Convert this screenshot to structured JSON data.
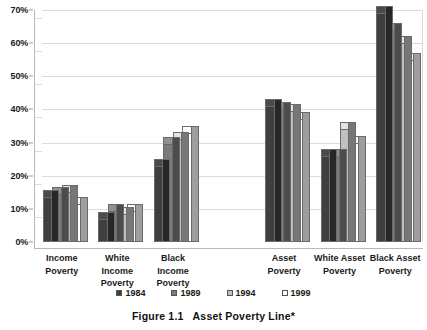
{
  "caption": {
    "figure_number": "Figure 1.1",
    "title": "Asset Poverty Line*"
  },
  "axis": {
    "yticks": [
      "0%",
      "10%",
      "20%",
      "30%",
      "40%",
      "50%",
      "60%",
      "70%"
    ],
    "ylabel": "",
    "xlabel": ""
  },
  "legend": {
    "entries": [
      {
        "label": "1984",
        "color": "#3f3f3f"
      },
      {
        "label": "1989",
        "color": "#7b7b7b"
      },
      {
        "label": "1994",
        "color": "#c0c0c0"
      },
      {
        "label": "1999",
        "color": "#ffffff"
      }
    ]
  },
  "categories": [
    {
      "line1": "Income",
      "line2": "Poverty"
    },
    {
      "line1": "White",
      "line2": "Income",
      "line3": "Poverty"
    },
    {
      "line1": "Black",
      "line2": "Income",
      "line3": "Poverty"
    },
    {
      "line1": "",
      "line2": ""
    },
    {
      "line1": "Asset",
      "line2": "Poverty"
    },
    {
      "line1": "White Asset",
      "line2": "Poverty"
    },
    {
      "line1": "Black Asset",
      "line2": "Poverty"
    }
  ],
  "chart_data": {
    "type": "bar",
    "xlabel": "",
    "ylabel": "",
    "ylim": [
      0,
      70
    ],
    "ytick_interval": 10,
    "grid": true,
    "legend_position": "bottom",
    "three_d": true,
    "categories": [
      "Income Poverty",
      "White Income Poverty",
      "Black Income Poverty",
      "",
      "Asset Poverty",
      "White Asset Poverty",
      "Black Asset Poverty"
    ],
    "series": [
      {
        "name": "1984",
        "color": "#3f3f3f",
        "values": [
          13.5,
          7.0,
          23.0,
          null,
          41.0,
          26.0,
          69.0
        ]
      },
      {
        "name": "1989",
        "color": "#7b7b7b",
        "values": [
          14.5,
          9.5,
          29.5,
          null,
          40.0,
          26.0,
          64.0
        ]
      },
      {
        "name": "1994",
        "color": "#c0c0c0",
        "values": [
          15.0,
          8.5,
          31.0,
          null,
          39.5,
          34.0,
          60.0
        ]
      },
      {
        "name": "1999",
        "color": "#ffffff",
        "values": [
          11.5,
          9.5,
          33.0,
          null,
          37.0,
          30.0,
          55.0
        ]
      }
    ]
  }
}
